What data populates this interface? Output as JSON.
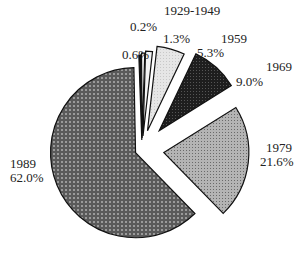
{
  "chart_data": {
    "type": "pie",
    "title": "",
    "exploded": true,
    "slices": [
      {
        "label": "1929-1949",
        "value": 0.2,
        "value_label": "0.2%",
        "fill": "#111111",
        "pattern": "solid"
      },
      {
        "label": "",
        "value": 0.6,
        "value_label": "0.6%",
        "fill": "#ffffff",
        "pattern": "solid"
      },
      {
        "label": "",
        "value": 1.3,
        "value_label": "1.3%",
        "fill": "#f4f4f4",
        "pattern": "solid"
      },
      {
        "label": "1959",
        "value": 5.3,
        "value_label": "5.3%",
        "fill": "#e2e2e2",
        "pattern": "light-dots"
      },
      {
        "label": "1969",
        "value": 9.0,
        "value_label": "9.0%",
        "fill": "#2a2a2a",
        "pattern": "dark-dots"
      },
      {
        "label": "1979",
        "value": 21.6,
        "value_label": "21.6%",
        "fill": "#a8a8a8",
        "pattern": "fine-cross"
      },
      {
        "label": "1989",
        "value": 62.0,
        "value_label": "62.0%",
        "fill": "#6e6e6e",
        "pattern": "diamond-cross"
      }
    ]
  },
  "labels": {
    "l1929": "1929-1949",
    "p02": "0.2%",
    "p06": "0.6%",
    "p13": "1.3%",
    "l1959": "1959",
    "p53": "5.3%",
    "l1969": "1969",
    "p90": "9.0%",
    "l1979": "1979",
    "p216": "21.6%",
    "l1989": "1989",
    "p620": "62.0%"
  }
}
